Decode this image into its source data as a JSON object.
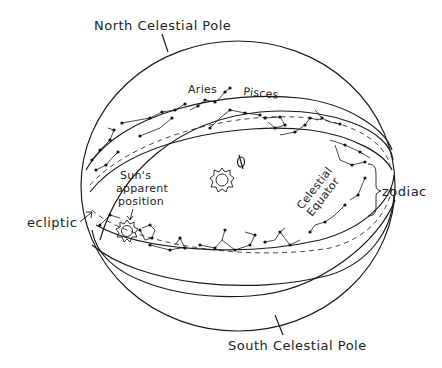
{
  "diagram": {
    "labels": {
      "north_pole": "North Celestial Pole",
      "south_pole": "South Celestial Pole",
      "aries": "Aries",
      "pisces": "Pisces",
      "sun_position_line1": "Sun's",
      "sun_position_line2": "apparent",
      "sun_position_line3": "position",
      "ecliptic": "ecliptic",
      "equator_line1": "Celestial",
      "equator_line2": "Equator",
      "zodiac": "zodiac"
    },
    "elements": [
      {
        "name": "celestial-sphere",
        "type": "circle"
      },
      {
        "name": "zodiac-band",
        "type": "band",
        "contains": "constellations"
      },
      {
        "name": "ecliptic",
        "type": "dashed-line"
      },
      {
        "name": "celestial-equator",
        "type": "ellipse"
      },
      {
        "name": "sun",
        "type": "icon",
        "location": "center"
      },
      {
        "name": "earth",
        "type": "icon",
        "location": "center"
      },
      {
        "name": "sun-apparent",
        "type": "icon",
        "location": "on ecliptic"
      }
    ],
    "colors": {
      "ink": "#1a1a1a",
      "background": "#ffffff"
    }
  }
}
